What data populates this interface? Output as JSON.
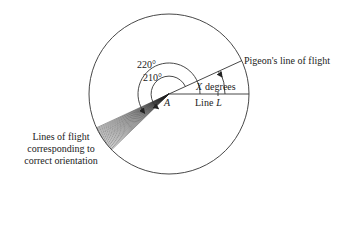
{
  "figure": {
    "type": "geometric diagram",
    "labels": {
      "angle_outer": "220°",
      "angle_inner": "210°",
      "vertex": "A",
      "x_angle_var": "X",
      "x_angle_unit": "degrees",
      "line_l_word": "Line",
      "line_l_var": "L",
      "pigeon_line": "Pigeon's line of flight",
      "fan_caption": [
        "Lines of flight",
        "corresponding to",
        "correct orientation"
      ]
    },
    "geometry": {
      "circle_center": [
        169,
        94
      ],
      "circle_radius": 80,
      "pigeon_line_angle_deg": 24.6,
      "outer_arc_deg": 220,
      "inner_arc_deg": 210,
      "fan_angle_range_deg": [
        205,
        225
      ]
    },
    "colors": {
      "ink": "#222222",
      "background": "#ffffff"
    }
  }
}
